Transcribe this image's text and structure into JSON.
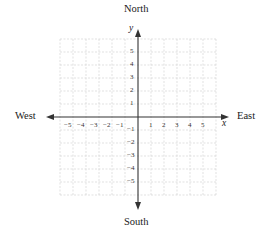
{
  "labels": {
    "north": "North",
    "south": "South",
    "east": "East",
    "west": "West"
  },
  "axes": {
    "x_label": "x",
    "y_label": "y",
    "x_ticks": [
      "−5",
      "−4",
      "−3",
      "−2",
      "−1",
      "1",
      "2",
      "3",
      "4",
      "5"
    ],
    "y_ticks_positive": [
      "5",
      "4",
      "3",
      "2",
      "1"
    ],
    "y_ticks_negative": [
      "−1",
      "−2",
      "−3",
      "−4",
      "−5"
    ],
    "range": [
      -6,
      6
    ]
  },
  "colors": {
    "axis": "#333333",
    "grid": "#c8c8c8",
    "text": "#1a1a1a"
  }
}
